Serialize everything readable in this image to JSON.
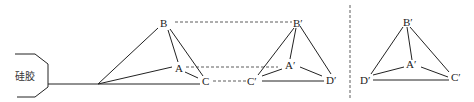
{
  "diagram": {
    "type": "geometry-projection",
    "silica_gel": {
      "label": "硅胶"
    },
    "figure_left": {
      "vertices": {
        "B": "B",
        "A": "A",
        "C": "C"
      }
    },
    "figure_middle": {
      "vertices": {
        "B": "B′",
        "A": "A′",
        "C": "C′",
        "D": "D′"
      }
    },
    "figure_right": {
      "vertices": {
        "B": "B′",
        "A": "A′",
        "D": "D′",
        "C": "C′"
      }
    },
    "colors": {
      "line": "#222222",
      "background": "#ffffff"
    }
  }
}
